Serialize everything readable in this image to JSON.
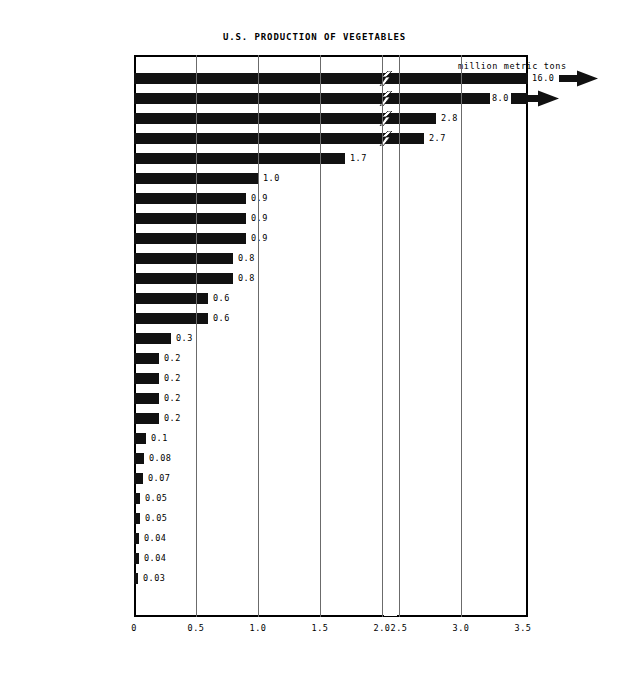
{
  "chart_data": {
    "type": "bar",
    "orientation": "horizontal",
    "title": "U.S. PRODUCTION OF VEGETABLES",
    "xlabel": "",
    "ylabel": "",
    "unit_caption": "million metric tons",
    "xlim": [
      0,
      3.5
    ],
    "axis_break": {
      "from": 2.0,
      "to": 2.5,
      "note": "scale break between 2.0 and 2.5"
    },
    "grid": true,
    "legend": "none",
    "xticks": [
      "0",
      "0.5",
      "1.0",
      "1.5",
      "2.0",
      "2.5",
      "3.0",
      "3.5"
    ],
    "xtick_values": [
      0,
      0.5,
      1.0,
      1.5,
      2.0,
      2.5,
      3.0,
      3.5
    ],
    "categories": [
      "POTATOES, IRISH",
      "TOMATOES",
      "CORN, SWEET",
      "LETTUCE",
      "ONIONS",
      "CABBAGE",
      "BEANS, DRIED",
      "CARROTS",
      "CUCUMBERS",
      "CELERY",
      "BEANS, SNAP",
      "SWEET POTATOES",
      "PEAS, GREEN",
      "BROCCOLI",
      "BEETS",
      "PEPPERS, GREEN",
      "SPINACH",
      "CAULIFLOWER",
      "BEANS, LIMA",
      "ASPARAGUS",
      "OLIVE",
      "GARLIC",
      "ESCAROLE",
      "ARTICHOKES",
      "BRUSSELS SPROUTS",
      "EGGPLANT"
    ],
    "values": [
      16.0,
      8.0,
      2.8,
      2.7,
      1.7,
      1.0,
      0.9,
      0.9,
      0.9,
      0.8,
      0.8,
      0.6,
      0.6,
      0.3,
      0.2,
      0.2,
      0.2,
      0.2,
      0.1,
      0.08,
      0.07,
      0.05,
      0.05,
      0.04,
      0.04,
      0.03
    ],
    "value_labels": [
      "16.0",
      "8.0",
      "2.8",
      "2.7",
      "1.7",
      "1.0",
      "0.9",
      "0.9",
      "0.9",
      "0.8",
      "0.8",
      "0.6",
      "0.6",
      "0.3",
      "0.2",
      "0.2",
      "0.2",
      "0.2",
      "0.1",
      "0.08",
      "0.07",
      "0.05",
      "0.05",
      "0.04",
      "0.04",
      "0.03"
    ],
    "bars": [
      {
        "label": "POTATOES, IRISH",
        "value": 16.0,
        "value_label": "16.0",
        "broken": true,
        "offscale": true
      },
      {
        "label": "TOMATOES",
        "value": 8.0,
        "value_label": "8.0",
        "broken": true,
        "offscale": true
      },
      {
        "label": "CORN, SWEET",
        "value": 2.8,
        "value_label": "2.8",
        "broken": true,
        "offscale": false
      },
      {
        "label": "LETTUCE",
        "value": 2.7,
        "value_label": "2.7",
        "broken": true,
        "offscale": false
      },
      {
        "label": "ONIONS",
        "value": 1.7,
        "value_label": "1.7",
        "broken": false,
        "offscale": false
      },
      {
        "label": "CABBAGE",
        "value": 1.0,
        "value_label": "1.0",
        "broken": false,
        "offscale": false
      },
      {
        "label": "BEANS, DRIED",
        "value": 0.9,
        "value_label": "0.9",
        "broken": false,
        "offscale": false
      },
      {
        "label": "CARROTS",
        "value": 0.9,
        "value_label": "0.9",
        "broken": false,
        "offscale": false
      },
      {
        "label": "CUCUMBERS",
        "value": 0.9,
        "value_label": "0.9",
        "broken": false,
        "offscale": false
      },
      {
        "label": "CELERY",
        "value": 0.8,
        "value_label": "0.8",
        "broken": false,
        "offscale": false
      },
      {
        "label": "BEANS, SNAP",
        "value": 0.8,
        "value_label": "0.8",
        "broken": false,
        "offscale": false
      },
      {
        "label": "SWEET POTATOES",
        "value": 0.6,
        "value_label": "0.6",
        "broken": false,
        "offscale": false
      },
      {
        "label": "PEAS, GREEN",
        "value": 0.6,
        "value_label": "0.6",
        "broken": false,
        "offscale": false
      },
      {
        "label": "BROCCOLI",
        "value": 0.3,
        "value_label": "0.3",
        "broken": false,
        "offscale": false
      },
      {
        "label": "BEETS",
        "value": 0.2,
        "value_label": "0.2",
        "broken": false,
        "offscale": false
      },
      {
        "label": "PEPPERS, GREEN",
        "value": 0.2,
        "value_label": "0.2",
        "broken": false,
        "offscale": false
      },
      {
        "label": "SPINACH",
        "value": 0.2,
        "value_label": "0.2",
        "broken": false,
        "offscale": false
      },
      {
        "label": "CAULIFLOWER",
        "value": 0.2,
        "value_label": "0.2",
        "broken": false,
        "offscale": false
      },
      {
        "label": "BEANS, LIMA",
        "value": 0.1,
        "value_label": "0.1",
        "broken": false,
        "offscale": false
      },
      {
        "label": "ASPARAGUS",
        "value": 0.08,
        "value_label": "0.08",
        "broken": false,
        "offscale": false
      },
      {
        "label": "OLIVE",
        "value": 0.07,
        "value_label": "0.07",
        "broken": false,
        "offscale": false
      },
      {
        "label": "GARLIC",
        "value": 0.05,
        "value_label": "0.05",
        "broken": false,
        "offscale": false
      },
      {
        "label": "ESCAROLE",
        "value": 0.05,
        "value_label": "0.05",
        "broken": false,
        "offscale": false
      },
      {
        "label": "ARTICHOKES",
        "value": 0.04,
        "value_label": "0.04",
        "broken": false,
        "offscale": false
      },
      {
        "label": "BRUSSELS SPROUTS",
        "value": 0.04,
        "value_label": "0.04",
        "broken": false,
        "offscale": false
      },
      {
        "label": "EGGPLANT",
        "value": 0.03,
        "value_label": "0.03",
        "broken": false,
        "offscale": false
      }
    ],
    "colors": {
      "bar": "#111111",
      "axis": "#000000",
      "grid": "#6b6b6b",
      "background": "#ffffff",
      "text": "#000000"
    }
  }
}
